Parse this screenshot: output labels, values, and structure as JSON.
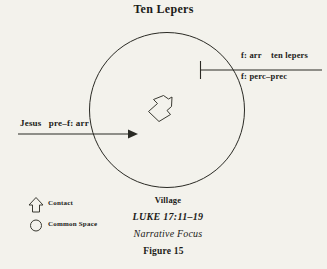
{
  "page": {
    "background_color": "#f3f2ec",
    "ink_color": "#1b1b18",
    "width": 327,
    "height": 269
  },
  "title": "Ten Lepers",
  "diagram": {
    "common_space_circle": {
      "name": "common-space-circle",
      "cx": 167,
      "cy": 110,
      "r": 77.5,
      "stroke": "#2a2a24"
    },
    "entry_arrow": {
      "name": "jesus-entry-arrow",
      "label": "Jesus   pre–f: arr",
      "direction": "right",
      "x1": 18,
      "x2": 136,
      "y": 134
    },
    "contact_arrow": {
      "name": "contact-arrow",
      "description": "hollow outlined arrow pointing down-left",
      "cx": 160,
      "cy": 108
    },
    "exit_line": {
      "name": "departure-line",
      "x1": 200,
      "x2": 322,
      "y": 70,
      "tick_top": 61,
      "tick_bottom": 79,
      "label_above": "f: arr    ten lepers",
      "label_below": "f: perc–prec"
    }
  },
  "legend": {
    "items": [
      {
        "icon": "up-arrow-icon",
        "label": "Contact"
      },
      {
        "icon": "circle-icon",
        "label": "Common Space"
      }
    ],
    "contact_label": "Contact",
    "common_space_label": "Common Space"
  },
  "caption": {
    "village": "Village",
    "scripture": "LUKE 17:11–19",
    "narrative_focus": "Narrative Focus",
    "figure_number": "Figure 15"
  }
}
